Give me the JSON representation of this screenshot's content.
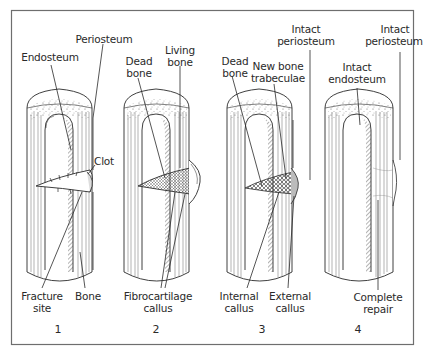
{
  "figure": {
    "colors": {
      "ink": "#2a2a2a",
      "frame": "#6e6e6e",
      "background": "#ffffff",
      "stipple": "#555555"
    },
    "panels": [
      {
        "number": "1",
        "labels": {
          "endosteum": "Endosteum",
          "periosteum": "Periosteum",
          "clot": "Clot",
          "fracture_site_1": "Fracture",
          "fracture_site_2": "site",
          "bone": "Bone"
        }
      },
      {
        "number": "2",
        "labels": {
          "dead_bone_1": "Dead",
          "dead_bone_2": "bone",
          "living_bone_1": "Living",
          "living_bone_2": "bone",
          "fibrocartilage_callus_1": "Fibrocartilage",
          "fibrocartilage_callus_2": "callus"
        }
      },
      {
        "number": "3",
        "labels": {
          "dead_bone_1": "Dead",
          "dead_bone_2": "bone",
          "new_bone_trabeculae_1": "New bone",
          "new_bone_trabeculae_2": "trabeculae",
          "intact_periosteum_1": "Intact",
          "intact_periosteum_2": "periosteum",
          "internal_callus_1": "Internal",
          "internal_callus_2": "callus",
          "external_callus_1": "External",
          "external_callus_2": "callus"
        }
      },
      {
        "number": "4",
        "labels": {
          "intact_periosteum_1": "Intact",
          "intact_periosteum_2": "periosteum",
          "intact_endosteum_1": "Intact",
          "intact_endosteum_2": "endosteum",
          "complete_repair_1": "Complete",
          "complete_repair_2": "repair"
        }
      }
    ]
  }
}
